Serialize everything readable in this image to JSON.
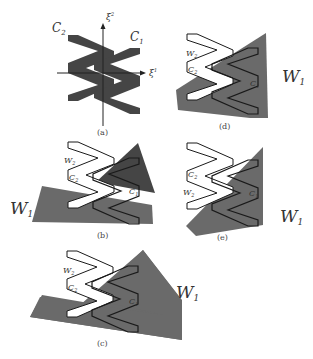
{
  "figure": {
    "colors": {
      "dark": "#454545",
      "gray": "#6a6a6a",
      "outline": "#1a1a1a",
      "white": "#ffffff"
    },
    "panels": [
      {
        "id": "a",
        "caption": "(a)",
        "labels": {
          "c1": "C",
          "c1_sub": "1",
          "c2": "C",
          "c2_sub": "2",
          "xi1": "ξ",
          "xi1_sup": "1",
          "xi2": "ξ",
          "xi2_sup": "2"
        }
      },
      {
        "id": "b",
        "caption": "(b)",
        "labels": {
          "w1": "W",
          "w1_sub": "1",
          "w2": "W",
          "w2_sub": "2",
          "c1": "C",
          "c1_sub": "1",
          "c2": "C",
          "c2_sub": "2"
        }
      },
      {
        "id": "c",
        "caption": "(c)",
        "labels": {
          "w1": "W",
          "w1_sub": "1",
          "w2": "W",
          "w2_sub": "2",
          "c1": "C",
          "c1_sub": "1",
          "c2": "C",
          "c2_sub": "2"
        }
      },
      {
        "id": "d",
        "caption": "(d)",
        "labels": {
          "w1": "W",
          "w1_sub": "1",
          "w2": "W",
          "w2_sub": "2",
          "c1": "C",
          "c1_sub": "1",
          "c2": "C",
          "c2_sub": "2"
        }
      },
      {
        "id": "e",
        "caption": "(e)",
        "labels": {
          "w1": "W",
          "w1_sub": "1",
          "w2": "W",
          "w2_sub": "2",
          "c1": "C",
          "c1_sub": "1",
          "c2": "C",
          "c2_sub": "2"
        }
      }
    ]
  }
}
